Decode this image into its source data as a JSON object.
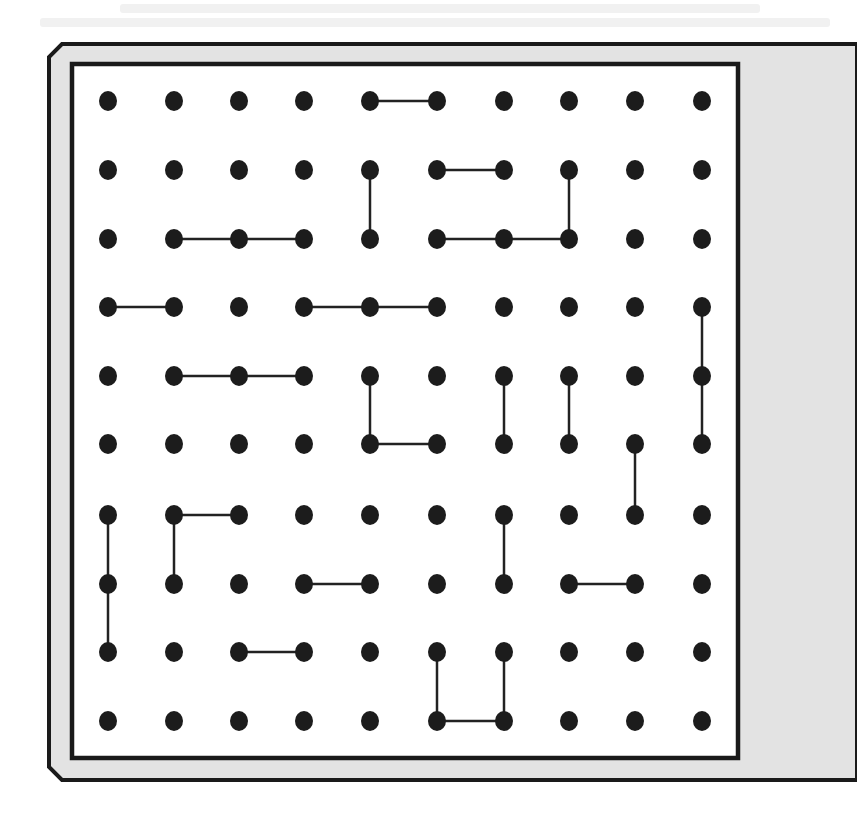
{
  "game": {
    "type": "dots-and-boxes",
    "grid": {
      "rows": 10,
      "cols": 10,
      "col_x": [
        108,
        174,
        239,
        304,
        370,
        437,
        504,
        569,
        635,
        702
      ],
      "row_y": [
        101,
        170,
        239,
        307,
        376,
        444,
        515,
        584,
        652,
        721
      ],
      "dot_rx": 9,
      "dot_ry": 10
    },
    "horizontal_lines": [
      {
        "row": 0,
        "from_col": 4,
        "to_col": 5
      },
      {
        "row": 1,
        "from_col": 5,
        "to_col": 6
      },
      {
        "row": 2,
        "from_col": 1,
        "to_col": 2
      },
      {
        "row": 2,
        "from_col": 2,
        "to_col": 3
      },
      {
        "row": 2,
        "from_col": 5,
        "to_col": 6
      },
      {
        "row": 2,
        "from_col": 6,
        "to_col": 7
      },
      {
        "row": 3,
        "from_col": 0,
        "to_col": 1
      },
      {
        "row": 3,
        "from_col": 3,
        "to_col": 4
      },
      {
        "row": 3,
        "from_col": 4,
        "to_col": 5
      },
      {
        "row": 4,
        "from_col": 1,
        "to_col": 2
      },
      {
        "row": 4,
        "from_col": 2,
        "to_col": 3
      },
      {
        "row": 5,
        "from_col": 4,
        "to_col": 5
      },
      {
        "row": 6,
        "from_col": 1,
        "to_col": 2
      },
      {
        "row": 7,
        "from_col": 3,
        "to_col": 4
      },
      {
        "row": 7,
        "from_col": 7,
        "to_col": 8
      },
      {
        "row": 8,
        "from_col": 2,
        "to_col": 3
      },
      {
        "row": 9,
        "from_col": 5,
        "to_col": 6
      }
    ],
    "vertical_lines": [
      {
        "col": 4,
        "from_row": 1,
        "to_row": 2
      },
      {
        "col": 7,
        "from_row": 1,
        "to_row": 2
      },
      {
        "col": 9,
        "from_row": 3,
        "to_row": 4
      },
      {
        "col": 9,
        "from_row": 4,
        "to_row": 5
      },
      {
        "col": 4,
        "from_row": 4,
        "to_row": 5
      },
      {
        "col": 6,
        "from_row": 4,
        "to_row": 5
      },
      {
        "col": 7,
        "from_row": 4,
        "to_row": 5
      },
      {
        "col": 8,
        "from_row": 5,
        "to_row": 6
      },
      {
        "col": 0,
        "from_row": 6,
        "to_row": 7
      },
      {
        "col": 0,
        "from_row": 7,
        "to_row": 8
      },
      {
        "col": 1,
        "from_row": 6,
        "to_row": 7
      },
      {
        "col": 6,
        "from_row": 6,
        "to_row": 7
      },
      {
        "col": 5,
        "from_row": 8,
        "to_row": 9
      },
      {
        "col": 6,
        "from_row": 8,
        "to_row": 9
      }
    ]
  },
  "frame": {
    "outer_border_color": "#1a1a1a",
    "gap_fill_color": "#e3e3e3",
    "inner_border_color": "#1a1a1a",
    "board_fill_color": "#ffffff",
    "gutter_color": "#e6e6e6"
  },
  "colors": {
    "dot": "#1c1c1c",
    "line": "#222222",
    "page_background": "#ffffff"
  }
}
